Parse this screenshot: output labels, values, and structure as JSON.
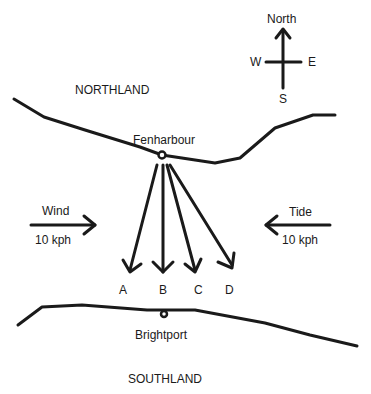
{
  "compass": {
    "north": "North",
    "south": "S",
    "east": "E",
    "west": "W"
  },
  "regions": {
    "north": "NORTHLAND",
    "south": "SOUTHLAND"
  },
  "ports": {
    "origin": "Fenharbour",
    "destination": "Brightport"
  },
  "wind": {
    "label": "Wind",
    "speed": "10 kph",
    "direction": "east"
  },
  "tide": {
    "label": "Tide",
    "speed": "10 kph",
    "direction": "west"
  },
  "routes": [
    {
      "label": "A"
    },
    {
      "label": "B"
    },
    {
      "label": "C"
    },
    {
      "label": "D"
    }
  ],
  "colors": {
    "ink": "#1a1a1a",
    "background": "#ffffff"
  }
}
